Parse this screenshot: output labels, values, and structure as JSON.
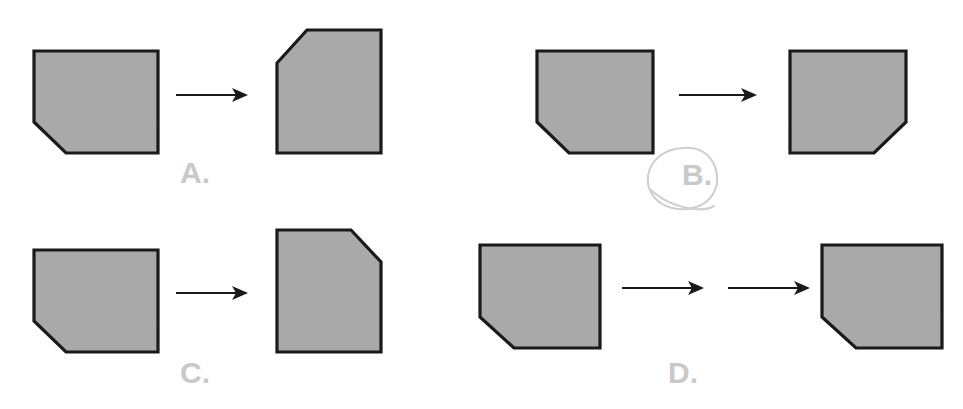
{
  "page": {
    "kind": "multiple-choice-figure",
    "width": 963,
    "height": 409,
    "background_color": "#ffffff"
  },
  "style": {
    "shape_fill": "#a9a9a9",
    "shape_outline": "#1a1a1a",
    "label_color": "#c9c9c9",
    "arrow_color": "#1a1a1a",
    "annotation_color": "#cfcfcf"
  },
  "annotation": {
    "type": "hand-drawn-circle",
    "target_label": "B.",
    "color": "#cfcfcf",
    "description": "hand drawn loop circling option B label"
  },
  "options": [
    {
      "id": "A",
      "label": "A.",
      "label_x": 180,
      "label_y": 158,
      "arrow_count": 1,
      "selected": false,
      "input_shape": {
        "name": "pentagon-cut-bottom-left",
        "cut_corner": "bottom-left",
        "orientation": "landscape",
        "points": "34,51 158,51 158,153 66,153 34,122"
      },
      "output_shape": {
        "name": "pentagon-cut-top-left",
        "cut_corner": "top-left",
        "orientation": "portrait",
        "points": "307,30 381,30 381,153 277,153 277,63"
      }
    },
    {
      "id": "B",
      "label": "B.",
      "label_x": 682,
      "label_y": 160,
      "arrow_count": 1,
      "selected": true,
      "input_shape": {
        "name": "pentagon-cut-bottom-left",
        "cut_corner": "bottom-left",
        "orientation": "landscape",
        "points": "537,51 653,51 653,153 569,153 537,122"
      },
      "output_shape": {
        "name": "pentagon-cut-bottom-right",
        "cut_corner": "bottom-right",
        "orientation": "landscape",
        "points": "790,51 906,51 906,122 874,153 790,153"
      }
    },
    {
      "id": "C",
      "label": "C.",
      "label_x": 180,
      "label_y": 358,
      "arrow_count": 1,
      "selected": false,
      "input_shape": {
        "name": "pentagon-cut-bottom-left",
        "cut_corner": "bottom-left",
        "orientation": "landscape",
        "points": "34,250 158,250 158,352 66,352 34,321"
      },
      "output_shape": {
        "name": "pentagon-cut-top-right",
        "cut_corner": "top-right",
        "orientation": "portrait",
        "points": "277,230 351,230 381,262 381,352 277,352"
      }
    },
    {
      "id": "D",
      "label": "D.",
      "label_x": 668,
      "label_y": 358,
      "arrow_count": 2,
      "selected": false,
      "input_shape": {
        "name": "pentagon-cut-bottom-left",
        "cut_corner": "bottom-left",
        "orientation": "landscape",
        "points": "480,245 600,245 600,348 514,348 480,317"
      },
      "output_shape": {
        "name": "pentagon-cut-bottom-left",
        "cut_corner": "bottom-left",
        "orientation": "landscape",
        "points": "822,245 942,245 942,348 856,348 822,317"
      }
    }
  ],
  "arrows": [
    {
      "id": "arrow-a",
      "x1": 176,
      "y1": 95,
      "x2": 243,
      "y2": 95
    },
    {
      "id": "arrow-b",
      "x1": 679,
      "y1": 95,
      "x2": 752,
      "y2": 95
    },
    {
      "id": "arrow-c",
      "x1": 176,
      "y1": 293,
      "x2": 243,
      "y2": 293
    },
    {
      "id": "arrow-d1",
      "x1": 622,
      "y1": 288,
      "x2": 699,
      "y2": 288
    },
    {
      "id": "arrow-d2",
      "x1": 728,
      "y1": 288,
      "x2": 805,
      "y2": 288
    }
  ]
}
